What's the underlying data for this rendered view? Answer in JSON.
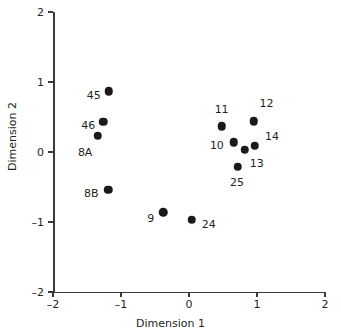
{
  "chart_data": {
    "type": "scatter",
    "title": "",
    "xlabel": "Dimension 1",
    "ylabel": "Dimension 2",
    "xlim": [
      -2,
      2
    ],
    "ylim": [
      -2,
      2
    ],
    "xticks": [
      "–2",
      "–1",
      "0",
      "1",
      "2"
    ],
    "xtick_values": [
      -2,
      -1,
      0,
      1,
      2
    ],
    "yticks": [
      "2",
      "1",
      "0",
      "–1",
      "–2"
    ],
    "ytick_values": [
      2,
      1,
      0,
      -1,
      -2
    ],
    "grid": false,
    "legend": null,
    "marker_color": "#1a1a1a",
    "axis_color": "#3b3b3b",
    "points": [
      {
        "label": "45",
        "x": -1.18,
        "y": 0.87,
        "label_dx": -22,
        "label_dy": 4
      },
      {
        "label": "46",
        "x": -1.26,
        "y": 0.43,
        "label_dx": -22,
        "label_dy": 4
      },
      {
        "label": "8A",
        "x": -1.34,
        "y": 0.23,
        "label_dx": -20,
        "label_dy": 17
      },
      {
        "label": "8B",
        "x": -1.19,
        "y": -0.54,
        "label_dx": -24,
        "label_dy": 4
      },
      {
        "label": "9",
        "x": -0.38,
        "y": -0.86,
        "label_dx": -16,
        "label_dy": 6
      },
      {
        "label": "24",
        "x": 0.04,
        "y": -0.97,
        "label_dx": 10,
        "label_dy": 5
      },
      {
        "label": "11",
        "x": 0.48,
        "y": 0.37,
        "label_dx": -7,
        "label_dy": -17
      },
      {
        "label": "12",
        "x": 0.95,
        "y": 0.44,
        "label_dx": 6,
        "label_dy": -18
      },
      {
        "label": "10",
        "x": 0.66,
        "y": 0.14,
        "label_dx": -24,
        "label_dy": 3
      },
      {
        "label": "14",
        "x": 0.97,
        "y": 0.09,
        "label_dx": 10,
        "label_dy": -9
      },
      {
        "label": "13",
        "x": 0.82,
        "y": 0.03,
        "label_dx": 5,
        "label_dy": 14
      },
      {
        "label": "25",
        "x": 0.72,
        "y": -0.21,
        "label_dx": -8,
        "label_dy": 16
      }
    ]
  }
}
